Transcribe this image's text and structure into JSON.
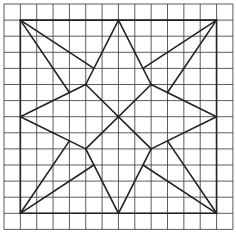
{
  "diagram": {
    "title": "",
    "type": "star-quilt-pattern-on-grid",
    "grid": {
      "cols": 14,
      "rows": 14,
      "origin_px": [
        4,
        4
      ],
      "cell_px": [
        16.35,
        16.1
      ],
      "color": "#333333"
    },
    "frame": {
      "description": "outer square",
      "from": [
        1,
        1
      ],
      "to": [
        13,
        13
      ]
    },
    "stroke_color": "#222222",
    "segments": [
      [
        [
          1,
          1
        ],
        [
          13,
          1
        ]
      ],
      [
        [
          13,
          1
        ],
        [
          13,
          13
        ]
      ],
      [
        [
          13,
          13
        ],
        [
          1,
          13
        ]
      ],
      [
        [
          1,
          13
        ],
        [
          1,
          1
        ]
      ],
      [
        [
          7,
          1
        ],
        [
          5,
          5
        ]
      ],
      [
        [
          7,
          1
        ],
        [
          9,
          5
        ]
      ],
      [
        [
          1,
          7
        ],
        [
          5,
          5
        ]
      ],
      [
        [
          1,
          7
        ],
        [
          5,
          9
        ]
      ],
      [
        [
          13,
          7
        ],
        [
          9,
          5
        ]
      ],
      [
        [
          13,
          7
        ],
        [
          9,
          9
        ]
      ],
      [
        [
          7,
          13
        ],
        [
          5,
          9
        ]
      ],
      [
        [
          7,
          13
        ],
        [
          9,
          9
        ]
      ],
      [
        [
          5,
          5
        ],
        [
          9,
          9
        ]
      ],
      [
        [
          9,
          5
        ],
        [
          5,
          9
        ]
      ],
      [
        [
          1,
          1
        ],
        [
          5.5,
          4
        ]
      ],
      [
        [
          1,
          1
        ],
        [
          4,
          5.5
        ]
      ],
      [
        [
          13,
          1
        ],
        [
          8.5,
          4
        ]
      ],
      [
        [
          13,
          1
        ],
        [
          10,
          5.5
        ]
      ],
      [
        [
          1,
          13
        ],
        [
          4,
          8.5
        ]
      ],
      [
        [
          1,
          13
        ],
        [
          5.5,
          10
        ]
      ],
      [
        [
          13,
          13
        ],
        [
          10,
          8.5
        ]
      ],
      [
        [
          13,
          13
        ],
        [
          8.5,
          10
        ]
      ]
    ]
  }
}
